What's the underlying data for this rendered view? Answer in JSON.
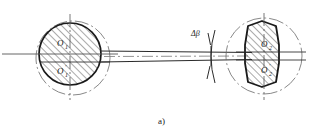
{
  "figure": {
    "caption": "a)",
    "background_color": "#ffffff",
    "line_color": "#1a1a1a",
    "thin_line_color": "#555555",
    "hatch_color": "#2b2b2b"
  },
  "left_section": {
    "name": "circular-cross-section",
    "center_label": "O",
    "center_label_sub": "1",
    "lower_label": "O",
    "lower_label_sub": "1",
    "lower_label_prime": "'",
    "outer_circle_style": "chain-dash-dot",
    "inner_circle_style": "solid-bold",
    "fill": "hatched-45deg"
  },
  "right_section": {
    "name": "barrel-cross-section",
    "center_label": "O",
    "center_label_sub": "2",
    "lower_label": "O",
    "lower_label_sub": "2",
    "lower_label_prime": "'",
    "outer_circle_style": "chain-dash-dot",
    "inner_shape_style": "solid-bold-barrel",
    "fill": "hatched-45deg"
  },
  "annotation": {
    "angle_symbol": "Δβ",
    "marker": "angular-deviation-arc"
  },
  "shaft": {
    "name": "connecting-shaft",
    "centerline_style": "dash-dot"
  }
}
